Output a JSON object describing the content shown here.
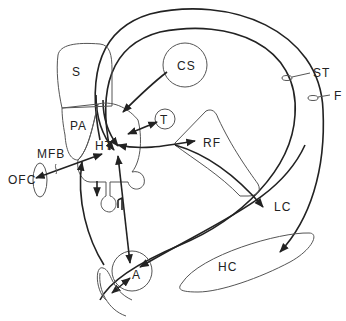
{
  "diagram": {
    "type": "neuroanatomical schematic",
    "labels": {
      "S": "S",
      "PA": "PA",
      "HT": "HT",
      "CS": "CS",
      "T": "T",
      "RF": "RF",
      "ST": "ST",
      "F": "F",
      "MFB": "MFB",
      "OFC": "OFC",
      "LC": "LC",
      "A": "A",
      "HC": "HC"
    },
    "connections": [
      {
        "from": "ST",
        "to": "HT"
      },
      {
        "from": "F",
        "to": "HT"
      },
      {
        "from": "F",
        "to": "HC"
      },
      {
        "from": "CS",
        "to": "HT"
      },
      {
        "from": "HT",
        "to": "T",
        "bidirectional": true
      },
      {
        "from": "HT",
        "to": "RF",
        "bidirectional": true
      },
      {
        "from": "RF",
        "to": "LC"
      },
      {
        "from": "HT",
        "to": "OFC",
        "bidirectional": true,
        "via": "MFB"
      },
      {
        "from": "HT",
        "to": "A",
        "bidirectional": true
      },
      {
        "from": "LC",
        "to": "A"
      },
      {
        "from": "A",
        "to": "HT"
      },
      {
        "from": "HT",
        "to": "P"
      }
    ]
  }
}
